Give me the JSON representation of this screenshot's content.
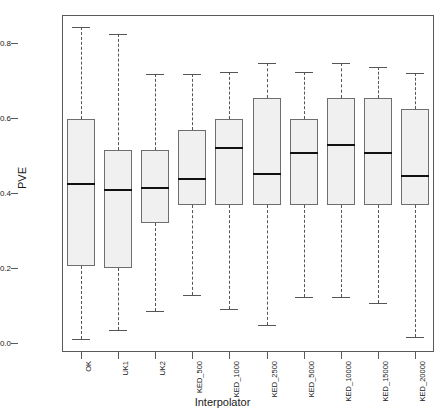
{
  "chart_data": {
    "type": "boxplot",
    "title": "",
    "xlabel": "Interpolator",
    "ylabel": "PVE",
    "ylim": [
      0.0,
      0.88
    ],
    "yticks": [
      0.0,
      0.2,
      0.4,
      0.6,
      0.8
    ],
    "ytick_labels": [
      "0.0",
      "0.2",
      "0.4",
      "0.6",
      "0.8"
    ],
    "grid": false,
    "legend": "none",
    "categories": [
      "OK",
      "UK1",
      "UK2",
      "KED_500",
      "KED_1000",
      "KED_2500",
      "KED_5000",
      "KED_10000",
      "KED_15000",
      "KED_20000"
    ],
    "boxes": [
      {
        "category": "OK",
        "whisker_low": 0.01,
        "q1": 0.205,
        "median": 0.424,
        "q3": 0.597,
        "whisker_high": 0.843
      },
      {
        "category": "UK1",
        "whisker_low": 0.035,
        "q1": 0.2,
        "median": 0.408,
        "q3": 0.515,
        "whisker_high": 0.825
      },
      {
        "category": "UK2",
        "whisker_low": 0.085,
        "q1": 0.32,
        "median": 0.413,
        "q3": 0.515,
        "whisker_high": 0.717
      },
      {
        "category": "KED_500",
        "whisker_low": 0.128,
        "q1": 0.368,
        "median": 0.437,
        "q3": 0.568,
        "whisker_high": 0.717
      },
      {
        "category": "KED_1000",
        "whisker_low": 0.09,
        "q1": 0.368,
        "median": 0.52,
        "q3": 0.597,
        "whisker_high": 0.723
      },
      {
        "category": "KED_2500",
        "whisker_low": 0.048,
        "q1": 0.368,
        "median": 0.45,
        "q3": 0.653,
        "whisker_high": 0.747
      },
      {
        "category": "KED_5000",
        "whisker_low": 0.123,
        "q1": 0.368,
        "median": 0.507,
        "q3": 0.597,
        "whisker_high": 0.723
      },
      {
        "category": "KED_10000",
        "whisker_low": 0.123,
        "q1": 0.368,
        "median": 0.528,
        "q3": 0.653,
        "whisker_high": 0.747
      },
      {
        "category": "KED_15000",
        "whisker_low": 0.107,
        "q1": 0.368,
        "median": 0.507,
        "q3": 0.653,
        "whisker_high": 0.735
      },
      {
        "category": "KED_20000",
        "whisker_low": 0.017,
        "q1": 0.368,
        "median": 0.445,
        "q3": 0.625,
        "whisker_high": 0.72
      }
    ],
    "style": {
      "box_fill": "#f0f0f0",
      "box_border": "#6e6e6e",
      "median_color": "#111111",
      "whisker_color": "#555555",
      "frame_color": "#5a5a5a",
      "background": "#ffffff"
    }
  }
}
